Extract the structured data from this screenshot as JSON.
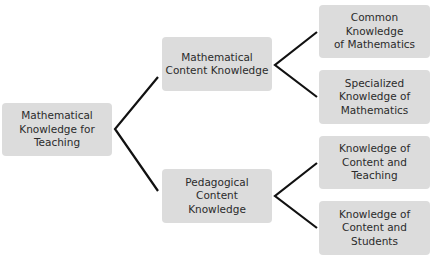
{
  "diagram": {
    "type": "tree",
    "root": {
      "label": "Mathematical\nKnowledge for\nTeaching"
    },
    "branches": [
      {
        "label": "Mathematical\nContent Knowledge",
        "children": [
          {
            "label": "Common Knowledge\nof Mathematics"
          },
          {
            "label": "Specialized\nKnowledge of\nMathematics"
          }
        ]
      },
      {
        "label": "Pedagogical Content\nKnowledge",
        "children": [
          {
            "label": "Knowledge of\nContent and\nTeaching"
          },
          {
            "label": "Knowledge of\nContent and\nStudents"
          }
        ]
      }
    ]
  },
  "colors": {
    "box_fill": "#dcdcdc",
    "text": "#2b2b2b",
    "connector": "#111111",
    "background": "#ffffff"
  }
}
